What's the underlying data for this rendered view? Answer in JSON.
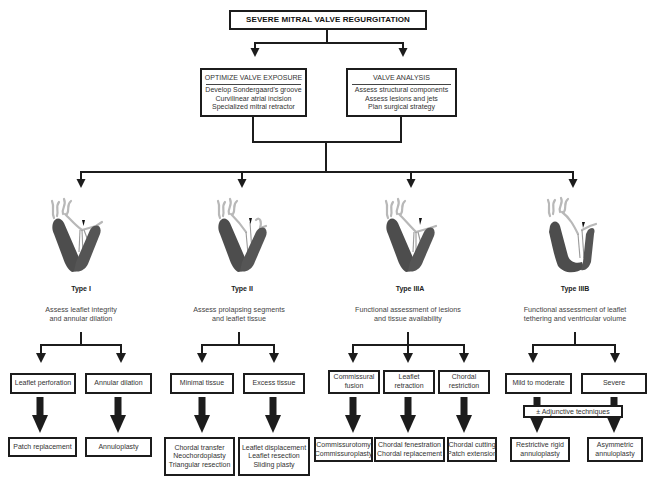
{
  "title": "SEVERE MITRAL VALVE REGURGITATION",
  "steps": [
    {
      "heading": "OPTIMIZE VALVE EXPOSURE",
      "lines": [
        "Develop Sondergaard's groove",
        "Curvilinear atrial incision",
        "Specialized mitral retractor"
      ]
    },
    {
      "heading": "VALVE ANALYSIS",
      "lines": [
        "Assess structural components",
        "Assess lesions and jets",
        "Plan surgical strategy"
      ]
    }
  ],
  "types": [
    {
      "label": "Type I",
      "icon": "heart-valve-illustration",
      "assessment": [
        "Assess leaflet integrity",
        "and annular dilation"
      ],
      "lesions": [
        [
          "Leaflet perforation"
        ],
        [
          "Annular dilation"
        ]
      ],
      "techniques": [
        [
          "Patch replacement"
        ],
        [
          "Annuloplasty"
        ]
      ]
    },
    {
      "label": "Type II",
      "icon": "heart-valve-illustration",
      "assessment": [
        "Assess prolapsing segments",
        "and leaflet tissue"
      ],
      "lesions": [
        [
          "Minimal tissue"
        ],
        [
          "Excess tissue"
        ]
      ],
      "techniques": [
        [
          "Chordal transfer",
          "Neochordoplasty",
          "Triangular resection"
        ],
        [
          "Leaflet displacement",
          "Leaflet resection",
          "Sliding plasty"
        ]
      ]
    },
    {
      "label": "Type IIIA",
      "icon": "heart-valve-illustration",
      "assessment": [
        "Functional assessment of lesions",
        "and tissue availability"
      ],
      "lesions": [
        [
          "Commissural",
          "fusion"
        ],
        [
          "Leaflet",
          "retraction"
        ],
        [
          "Chordal",
          "restriction"
        ]
      ],
      "techniques": [
        [
          "Commissurotomy",
          "Commissuroplasty"
        ],
        [
          "Chordal fenestration",
          "Chordal replacement"
        ],
        [
          "Chordal cutting",
          "Patch extension"
        ]
      ]
    },
    {
      "label": "Type IIIB",
      "icon": "heart-valve-illustration",
      "assessment": [
        "Functional assessment of leaflet",
        "tethering and ventricular volume"
      ],
      "lesions": [
        [
          "Mild to moderate"
        ],
        [
          "Severe"
        ]
      ],
      "adjunctive": "± Adjunctive techniques",
      "techniques": [
        [
          "Restrictive rigid",
          "annuloplasty"
        ],
        [
          "Asymmetric",
          "annuloplasty"
        ]
      ]
    }
  ],
  "colors": {
    "line": "#1c1c1c",
    "myocardium": "#4d4d4d",
    "vessel": "#b8b8b8",
    "text": "#333333"
  }
}
